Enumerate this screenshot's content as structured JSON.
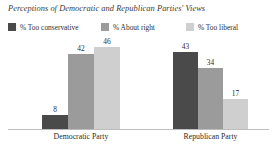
{
  "chart_data": {
    "type": "bar",
    "title": "Perceptions of Democratic and Republican Parties' Views",
    "xlabel": "",
    "ylabel": "",
    "ylim": [
      0,
      50
    ],
    "grid": false,
    "legend_position": "top-left",
    "categories": [
      "Democratic Party",
      "Republican Party"
    ],
    "series": [
      {
        "name": "% Too conservative",
        "values": [
          8,
          43
        ],
        "color": "#4a4a4a"
      },
      {
        "name": "% About right",
        "values": [
          42,
          34
        ],
        "color": "#9b9b9b"
      },
      {
        "name": "% Too liberal",
        "values": [
          46,
          17
        ],
        "color": "#cfcfcf"
      }
    ],
    "data_labels": [
      [
        "8",
        "42",
        "46"
      ],
      [
        "43",
        "34",
        "17"
      ]
    ],
    "axis_line_color": "#bdbdbd",
    "background": "#ffffff"
  }
}
